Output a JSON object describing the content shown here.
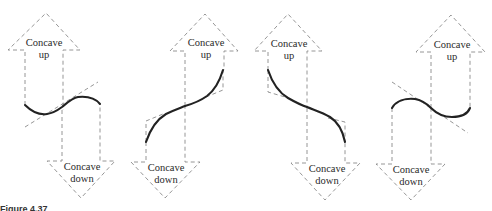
{
  "figure": {
    "caption": "Figure 4.37",
    "panels": [
      {
        "id": "panel-1",
        "up_label_line1": "Concave",
        "up_label_line2": "up",
        "down_label_line1": "Concave",
        "down_label_line2": "down",
        "curve_shape": "rising inflection, concave up then concave down"
      },
      {
        "id": "panel-2",
        "up_label_line1": "Concave",
        "up_label_line2": "up",
        "down_label_line1": "Concave",
        "down_label_line2": "down",
        "curve_shape": "rising inflection, concave down then concave up"
      },
      {
        "id": "panel-3",
        "up_label_line1": "Concave",
        "up_label_line2": "up",
        "down_label_line1": "Concave",
        "down_label_line2": "down",
        "curve_shape": "falling inflection, concave up then concave down"
      },
      {
        "id": "panel-4",
        "up_label_line1": "Concave",
        "up_label_line2": "up",
        "down_label_line1": "Concave",
        "down_label_line2": "down",
        "curve_shape": "falling inflection, concave down then concave up"
      }
    ],
    "colors": {
      "curve": "#222222",
      "dashed": "#8a8a8a",
      "background": "#ffffff"
    }
  }
}
